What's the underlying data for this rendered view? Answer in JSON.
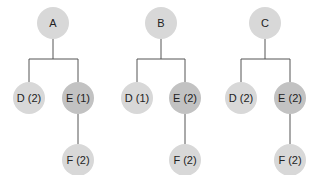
{
  "diagram": {
    "type": "tree-comparison",
    "colors": {
      "node_light": "#d8d8d8",
      "node_dark": "#c2c2c2",
      "edge": "#555555",
      "text": "#222222",
      "background": "#ffffff"
    },
    "trees": [
      {
        "root": {
          "label": "A",
          "x": 53,
          "y": 23
        },
        "bar_y": 59,
        "children": [
          {
            "label": "D (2)",
            "x": 29,
            "y": 98,
            "shade": "light"
          },
          {
            "label": "E (1)",
            "x": 78,
            "y": 98,
            "shade": "dark"
          }
        ],
        "grandchild": {
          "label": "F (2)",
          "x": 78,
          "y": 160,
          "shade": "light"
        }
      },
      {
        "root": {
          "label": "B",
          "x": 161,
          "y": 23
        },
        "bar_y": 59,
        "children": [
          {
            "label": "D (1)",
            "x": 137,
            "y": 98,
            "shade": "light"
          },
          {
            "label": "E (2)",
            "x": 185,
            "y": 98,
            "shade": "dark"
          }
        ],
        "grandchild": {
          "label": "F (2)",
          "x": 185,
          "y": 160,
          "shade": "light"
        }
      },
      {
        "root": {
          "label": "C",
          "x": 265,
          "y": 23
        },
        "bar_y": 59,
        "children": [
          {
            "label": "D (2)",
            "x": 241,
            "y": 98,
            "shade": "light"
          },
          {
            "label": "E (2)",
            "x": 290,
            "y": 98,
            "shade": "dark"
          }
        ],
        "grandchild": {
          "label": "F (2)",
          "x": 290,
          "y": 160,
          "shade": "light"
        }
      }
    ]
  }
}
